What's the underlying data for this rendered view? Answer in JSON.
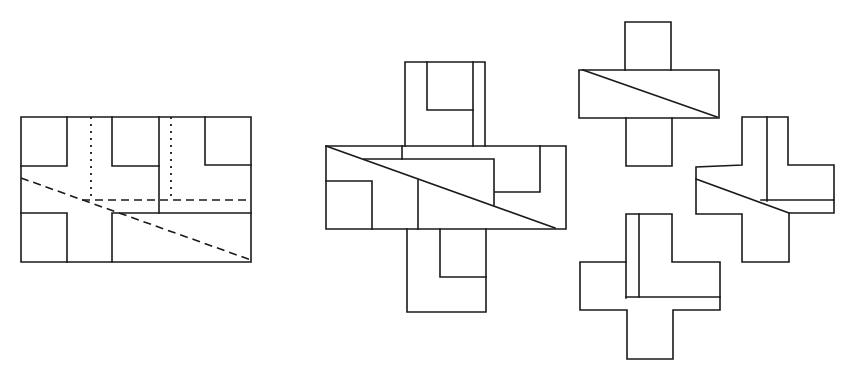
{
  "diagram": {
    "line_color": "#1a1a1a",
    "background": "#ffffff",
    "figures": [
      {
        "id": "source-rectangle",
        "label": "",
        "lines": [
          {
            "style": "solid",
            "points": [
              [
                21,
                117
              ],
              [
                251,
                117
              ],
              [
                251,
                262
              ],
              [
                21,
                262
              ],
              [
                21,
                117
              ]
            ]
          },
          {
            "style": "solid",
            "points": [
              [
                21,
                166
              ],
              [
                67,
                166
              ],
              [
                67,
                117
              ]
            ]
          },
          {
            "style": "solid",
            "points": [
              [
                112,
                117
              ],
              [
                112,
                166
              ],
              [
                159,
                166
              ]
            ]
          },
          {
            "style": "solid",
            "points": [
              [
                159,
                117
              ],
              [
                159,
                213
              ]
            ]
          },
          {
            "style": "solid",
            "points": [
              [
                205,
                117
              ],
              [
                205,
                165
              ],
              [
                251,
                165
              ]
            ]
          },
          {
            "style": "solid",
            "points": [
              [
                112,
                262
              ],
              [
                112,
                213
              ],
              [
                251,
                213
              ]
            ]
          },
          {
            "style": "solid",
            "points": [
              [
                21,
                213
              ],
              [
                67,
                213
              ],
              [
                67,
                262
              ]
            ]
          },
          {
            "style": "dotted",
            "points": [
              [
                91,
                117
              ],
              [
                91,
                200
              ]
            ]
          },
          {
            "style": "dotted",
            "points": [
              [
                171,
                117
              ],
              [
                171,
                199
              ]
            ]
          },
          {
            "style": "dashed",
            "points": [
              [
                82,
                200
              ],
              [
                251,
                200
              ]
            ]
          },
          {
            "style": "dashed",
            "points": [
              [
                21,
                178
              ],
              [
                251,
                260
              ]
            ]
          }
        ]
      },
      {
        "id": "large-cross",
        "label": "",
        "lines": [
          {
            "style": "solid",
            "points": [
              [
                405,
                146
              ],
              [
                405,
                62
              ],
              [
                485,
                62
              ],
              [
                485,
                146
              ]
            ]
          },
          {
            "style": "solid",
            "points": [
              [
                427,
                62
              ],
              [
                427,
                110
              ],
              [
                473,
                110
              ]
            ]
          },
          {
            "style": "solid",
            "points": [
              [
                473,
                62
              ],
              [
                473,
                146
              ]
            ]
          },
          {
            "style": "solid",
            "points": [
              [
                326,
                146
              ],
              [
                566,
                146
              ],
              [
                566,
                229
              ],
              [
                326,
                229
              ],
              [
                326,
                146
              ]
            ]
          },
          {
            "style": "solid",
            "points": [
              [
                402,
                146
              ],
              [
                402,
                159
              ]
            ]
          },
          {
            "style": "solid",
            "points": [
              [
                364,
                159
              ],
              [
                494,
                159
              ],
              [
                494,
                205
              ]
            ]
          },
          {
            "style": "solid",
            "points": [
              [
                540,
                146
              ],
              [
                540,
                192
              ],
              [
                495,
                192
              ]
            ]
          },
          {
            "style": "solid",
            "points": [
              [
                326,
                181
              ],
              [
                372,
                181
              ],
              [
                372,
                229
              ]
            ]
          },
          {
            "style": "solid",
            "points": [
              [
                418,
                180
              ],
              [
                418,
                229
              ]
            ]
          },
          {
            "style": "solid",
            "points": [
              [
                326,
                146
              ],
              [
                555,
                228
              ]
            ]
          },
          {
            "style": "solid",
            "points": [
              [
                407,
                229
              ],
              [
                407,
                312
              ],
              [
                486,
                312
              ],
              [
                486,
                229
              ]
            ]
          },
          {
            "style": "solid",
            "points": [
              [
                440,
                229
              ],
              [
                440,
                277
              ],
              [
                486,
                277
              ]
            ]
          }
        ]
      },
      {
        "id": "small-cross-top",
        "label": "",
        "lines": [
          {
            "style": "solid",
            "points": [
              [
                625,
                70
              ],
              [
                625,
                22
              ],
              [
                671,
                22
              ],
              [
                671,
                70
              ]
            ]
          },
          {
            "style": "solid",
            "points": [
              [
                579,
                70
              ],
              [
                719,
                70
              ],
              [
                719,
                118
              ],
              [
                579,
                118
              ],
              [
                579,
                70
              ]
            ]
          },
          {
            "style": "solid",
            "points": [
              [
                583,
                70
              ],
              [
                717,
                117
              ]
            ]
          },
          {
            "style": "solid",
            "points": [
              [
                626,
                118
              ],
              [
                626,
                166
              ],
              [
                672,
                166
              ],
              [
                672,
                118
              ]
            ]
          }
        ]
      },
      {
        "id": "small-cross-right",
        "label": "",
        "lines": [
          {
            "style": "solid",
            "points": [
              [
                742,
                165
              ],
              [
                742,
                117
              ],
              [
                788,
                117
              ],
              [
                788,
                165
              ],
              [
                834,
                165
              ],
              [
                834,
                213
              ],
              [
                789,
                213
              ],
              [
                789,
                262
              ],
              [
                742,
                262
              ],
              [
                742,
                214
              ],
              [
                696,
                214
              ],
              [
                696,
                167
              ],
              [
                742,
                165
              ]
            ]
          },
          {
            "style": "solid",
            "points": [
              [
                767,
                117
              ],
              [
                767,
                201
              ]
            ]
          },
          {
            "style": "solid",
            "points": [
              [
                761,
                200
              ],
              [
                834,
                200
              ]
            ]
          },
          {
            "style": "solid",
            "points": [
              [
                696,
                179
              ],
              [
                789,
                213
              ]
            ]
          }
        ]
      },
      {
        "id": "small-cross-bottom",
        "label": "",
        "lines": [
          {
            "style": "solid",
            "points": [
              [
                626,
                262
              ],
              [
                626,
                214
              ],
              [
                672,
                214
              ],
              [
                672,
                262
              ],
              [
                720,
                262
              ],
              [
                720,
                310
              ],
              [
                673,
                310
              ],
              [
                673,
                359
              ],
              [
                627,
                359
              ],
              [
                627,
                310
              ],
              [
                580,
                310
              ],
              [
                580,
                262
              ],
              [
                626,
                262
              ]
            ]
          },
          {
            "style": "solid",
            "points": [
              [
                626,
                262
              ],
              [
                626,
                298
              ]
            ]
          },
          {
            "style": "solid",
            "points": [
              [
                639,
                214
              ],
              [
                639,
                297
              ]
            ]
          },
          {
            "style": "solid",
            "points": [
              [
                626,
                297
              ],
              [
                720,
                297
              ]
            ]
          }
        ]
      }
    ]
  }
}
